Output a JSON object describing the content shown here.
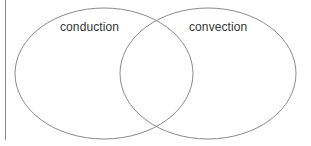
{
  "diagram": {
    "type": "venn",
    "sets": [
      {
        "label": "conduction"
      },
      {
        "label": "convection"
      }
    ],
    "colors": {
      "stroke": "#8a8a8a",
      "text": "#333333",
      "background": "#ffffff"
    }
  }
}
